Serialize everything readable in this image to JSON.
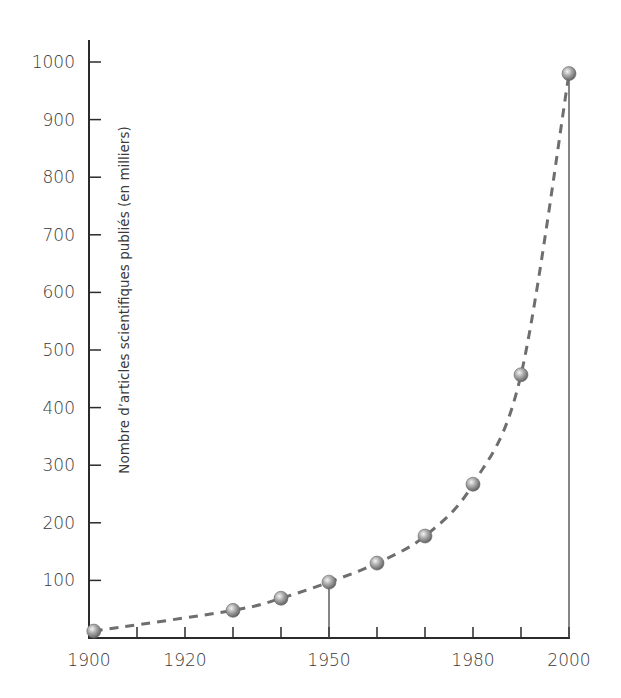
{
  "chart_data": {
    "type": "line",
    "title": "",
    "xlabel": "",
    "ylabel": "Nombre d’articles scientifiques publiés (en milliers)",
    "x_tick_labels": [
      "1900",
      "1920",
      "1950",
      "1980",
      "2000"
    ],
    "x_minor_ticks": [
      1910,
      1920,
      1930,
      1940,
      1950,
      1960,
      1970,
      1980,
      1990,
      2000
    ],
    "y_tick_labels": [
      "100",
      "200",
      "300",
      "400",
      "500",
      "600",
      "700",
      "800",
      "900",
      "1000"
    ],
    "xlim": [
      1900,
      2000
    ],
    "ylim": [
      0,
      1000
    ],
    "grid": false,
    "legend": null,
    "series": [
      {
        "name": "Nombre d’articles scientifiques publiés",
        "style": "dashed exponential trend with spherical markers",
        "x": [
          1901,
          1930,
          1940,
          1950,
          1960,
          1970,
          1980,
          1990,
          2000
        ],
        "values": [
          12,
          48,
          69,
          97,
          130,
          177,
          267,
          457,
          980
        ]
      }
    ],
    "annotations": [
      {
        "type": "vertical-drop-line",
        "x": 1950
      },
      {
        "type": "vertical-drop-line",
        "x": 2000
      }
    ],
    "colors": {
      "axis": "#2b2b2b",
      "curve": "#6e6e6e",
      "marker": "#9a9a9a",
      "text": "#3a3a3a"
    }
  }
}
